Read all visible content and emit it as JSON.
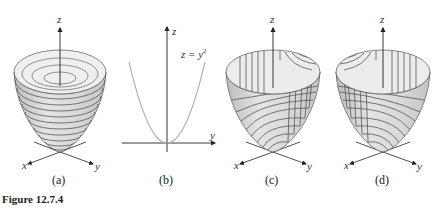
{
  "figure": {
    "caption": "Figure 12.7.4",
    "panels": [
      {
        "id": "a",
        "label": "(a)",
        "contours": "horizontal",
        "axes": {
          "z": "z",
          "x": "x",
          "y": "y"
        }
      },
      {
        "id": "b",
        "label": "(b)",
        "curve_label": "z = y",
        "curve_exponent": "2",
        "axes": {
          "z": "z",
          "y": "y"
        }
      },
      {
        "id": "c",
        "label": "(c)",
        "contours": "vertical-curves",
        "axes": {
          "z": "z",
          "x": "x",
          "y": "y"
        }
      },
      {
        "id": "d",
        "label": "(d)",
        "contours": "vertical-curves-mirrored",
        "axes": {
          "z": "z",
          "x": "x",
          "y": "y"
        }
      }
    ]
  },
  "colors": {
    "surface_fill": "#d9d9d9",
    "surface_inner": "#ececec",
    "contour": "#555555",
    "axis": "#222222",
    "curve": "#b0b0b0"
  }
}
